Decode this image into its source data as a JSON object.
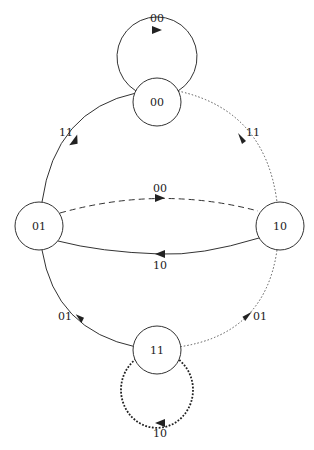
{
  "diagram": {
    "type": "state-transition-diagram",
    "nodes": [
      {
        "id": "00",
        "label": "00",
        "cx": 157,
        "cy": 102,
        "r": 24
      },
      {
        "id": "01",
        "label": "01",
        "cx": 39,
        "cy": 226,
        "r": 24
      },
      {
        "id": "10",
        "label": "10",
        "cx": 280,
        "cy": 226,
        "r": 24
      },
      {
        "id": "11",
        "label": "11",
        "cx": 157,
        "cy": 350,
        "r": 24
      }
    ],
    "edges": [
      {
        "from": "00",
        "to": "00",
        "label": "00",
        "style": "solid"
      },
      {
        "from": "01",
        "to": "00",
        "label": "11",
        "style": "solid"
      },
      {
        "from": "00",
        "to": "10",
        "label": "11",
        "style": "dotted"
      },
      {
        "from": "01",
        "to": "10",
        "label": "00",
        "style": "dashed"
      },
      {
        "from": "10",
        "to": "01",
        "label": "10",
        "style": "solid"
      },
      {
        "from": "11",
        "to": "01",
        "label": "01",
        "style": "solid"
      },
      {
        "from": "10",
        "to": "11",
        "label": "01",
        "style": "dotted"
      },
      {
        "from": "11",
        "to": "11",
        "label": "10",
        "style": "heavy-dotted"
      }
    ]
  }
}
